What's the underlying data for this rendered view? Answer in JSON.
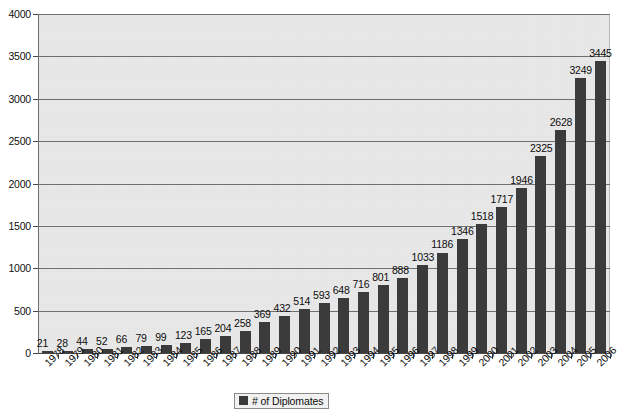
{
  "chart_data": {
    "type": "bar",
    "title": "",
    "xlabel": "",
    "ylabel": "",
    "ylim": [
      0,
      4000
    ],
    "ytick_step": 500,
    "grid": true,
    "legend_position": "bottom-center",
    "bar_color": "#3b3b3b",
    "plot_background": "#ececec",
    "categories": [
      "1978",
      "1979",
      "1980",
      "1981",
      "1982",
      "1983",
      "1984",
      "1985",
      "1986",
      "1987",
      "1988",
      "1989",
      "1990",
      "1991",
      "1992",
      "1993",
      "1994",
      "1995",
      "1996",
      "1997",
      "1998",
      "1999",
      "2000",
      "2001",
      "2002",
      "2003",
      "2004",
      "2005",
      "2006"
    ],
    "values": [
      21,
      28,
      44,
      52,
      66,
      79,
      99,
      123,
      165,
      204,
      258,
      369,
      432,
      514,
      593,
      648,
      716,
      801,
      888,
      1033,
      1186,
      1346,
      1518,
      1717,
      1946,
      2325,
      2628,
      3249,
      3445
    ],
    "data_labels": [
      "21",
      "28",
      "44",
      "52",
      "66",
      "79",
      "99",
      "123",
      "165",
      "204",
      "258",
      "369",
      "432",
      "514",
      "593",
      "648",
      "716",
      "801",
      "888",
      "1033",
      "1186",
      "1346",
      "1518",
      "1717",
      "1946",
      "2325",
      "2628",
      "3249",
      "3445"
    ],
    "ytick_labels": [
      "0",
      "500",
      "1000",
      "1500",
      "2000",
      "2500",
      "3000",
      "3500",
      "4000"
    ],
    "ytick_values": [
      0,
      500,
      1000,
      1500,
      2000,
      2500,
      3000,
      3500,
      4000
    ],
    "series": [
      {
        "name": "# of Diplomates",
        "values": [
          21,
          28,
          44,
          52,
          66,
          79,
          99,
          123,
          165,
          204,
          258,
          369,
          432,
          514,
          593,
          648,
          716,
          801,
          888,
          1033,
          1186,
          1346,
          1518,
          1717,
          1946,
          2325,
          2628,
          3249,
          3445
        ]
      }
    ],
    "legend": [
      "# of Diplomates"
    ]
  },
  "legend": {
    "label": "# of Diplomates"
  }
}
